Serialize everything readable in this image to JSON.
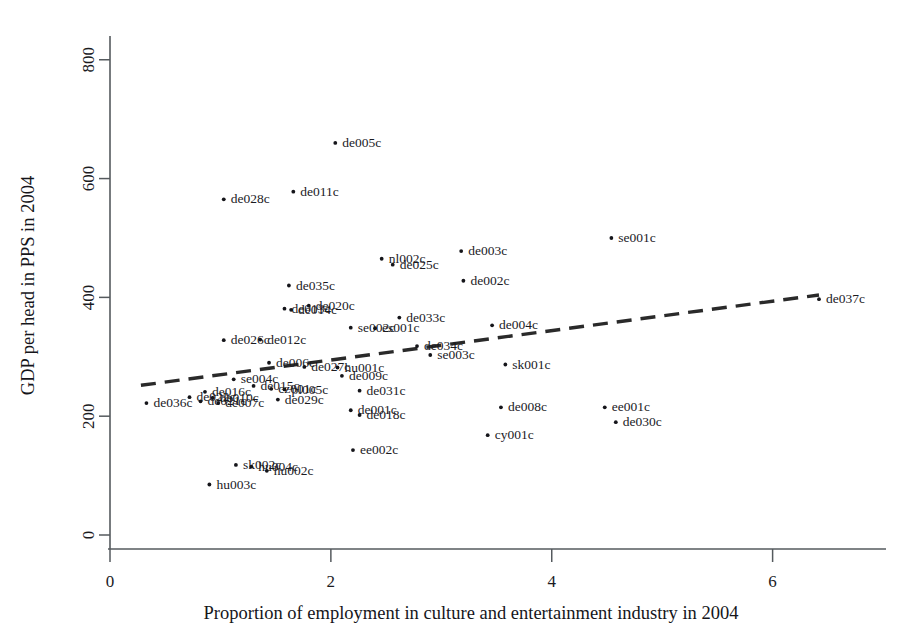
{
  "chart_data": {
    "type": "scatter",
    "title": "",
    "xlabel": "Proportion of employment in culture and entertainment industry in 2004",
    "ylabel": "GDP per head in PPS in 2004",
    "xlim": [
      0,
      6.9
    ],
    "ylim": [
      0,
      840
    ],
    "xticks": [
      "0",
      "2",
      "4",
      "6"
    ],
    "xtick_values": [
      0,
      2,
      4,
      6
    ],
    "yticks": [
      "0",
      "200",
      "400",
      "600",
      "800"
    ],
    "ytick_values": [
      0,
      200,
      400,
      600,
      800
    ],
    "grid": false,
    "legend": false,
    "marker": "dot",
    "label_position": "right-of-marker",
    "trend": {
      "style": "dashed",
      "x0": 0.28,
      "y0": 252,
      "x1": 6.42,
      "y1": 404
    },
    "points": [
      {
        "label": "de036c",
        "x": 0.33,
        "y": 222
      },
      {
        "label": "hu003c",
        "x": 0.9,
        "y": 85
      },
      {
        "label": "sk002c",
        "x": 1.14,
        "y": 118
      },
      {
        "label": "hu004c",
        "x": 1.28,
        "y": 115
      },
      {
        "label": "hu002c",
        "x": 1.42,
        "y": 108
      },
      {
        "label": "de022c",
        "x": 0.72,
        "y": 232
      },
      {
        "label": "de021c",
        "x": 0.82,
        "y": 225
      },
      {
        "label": "de016c",
        "x": 0.86,
        "y": 241
      },
      {
        "label": "de010c",
        "x": 0.93,
        "y": 231
      },
      {
        "label": "de007c",
        "x": 0.98,
        "y": 222
      },
      {
        "label": "de026c",
        "x": 1.03,
        "y": 328
      },
      {
        "label": "se004c",
        "x": 1.12,
        "y": 262
      },
      {
        "label": "de028c",
        "x": 1.03,
        "y": 565
      },
      {
        "label": "de015c",
        "x": 1.3,
        "y": 251
      },
      {
        "label": "cz001c",
        "x": 1.46,
        "y": 246
      },
      {
        "label": "pl005c",
        "x": 1.58,
        "y": 245
      },
      {
        "label": "de029c",
        "x": 1.52,
        "y": 228
      },
      {
        "label": "de012c",
        "x": 1.36,
        "y": 329
      },
      {
        "label": "de006c",
        "x": 1.44,
        "y": 290
      },
      {
        "label": "de011c",
        "x": 1.66,
        "y": 578
      },
      {
        "label": "de013c",
        "x": 1.58,
        "y": 381
      },
      {
        "label": "de014c",
        "x": 1.64,
        "y": 379
      },
      {
        "label": "de035c",
        "x": 1.62,
        "y": 420
      },
      {
        "label": "de020c",
        "x": 1.8,
        "y": 386
      },
      {
        "label": "de027c",
        "x": 1.76,
        "y": 283
      },
      {
        "label": "de005c",
        "x": 2.04,
        "y": 660
      },
      {
        "label": "de001c",
        "x": 2.18,
        "y": 210
      },
      {
        "label": "de018c",
        "x": 2.26,
        "y": 202
      },
      {
        "label": "ee002c",
        "x": 2.2,
        "y": 143
      },
      {
        "label": "de009c",
        "x": 2.1,
        "y": 268
      },
      {
        "label": "de031c",
        "x": 2.26,
        "y": 243
      },
      {
        "label": "hu001c",
        "x": 2.06,
        "y": 282
      },
      {
        "label": "se002c",
        "x": 2.18,
        "y": 349
      },
      {
        "label": "es001c",
        "x": 2.4,
        "y": 348
      },
      {
        "label": "nl002c",
        "x": 2.46,
        "y": 465
      },
      {
        "label": "de025c",
        "x": 2.56,
        "y": 455
      },
      {
        "label": "de033c",
        "x": 2.62,
        "y": 366
      },
      {
        "label": "de034c",
        "x": 2.78,
        "y": 318
      },
      {
        "label": "se003c",
        "x": 2.9,
        "y": 303
      },
      {
        "label": "de003c",
        "x": 3.18,
        "y": 478
      },
      {
        "label": "de002c",
        "x": 3.2,
        "y": 428
      },
      {
        "label": "de004c",
        "x": 3.46,
        "y": 353
      },
      {
        "label": "sk001c",
        "x": 3.58,
        "y": 287
      },
      {
        "label": "de008c",
        "x": 3.54,
        "y": 215
      },
      {
        "label": "cy001c",
        "x": 3.42,
        "y": 168
      },
      {
        "label": "se001c",
        "x": 4.54,
        "y": 500
      },
      {
        "label": "ee001c",
        "x": 4.48,
        "y": 215
      },
      {
        "label": "de030c",
        "x": 4.58,
        "y": 190
      },
      {
        "label": "de037c",
        "x": 6.42,
        "y": 397
      }
    ]
  },
  "axes": {
    "x_axis_name": "x-axis",
    "y_axis_name": "y-axis"
  }
}
